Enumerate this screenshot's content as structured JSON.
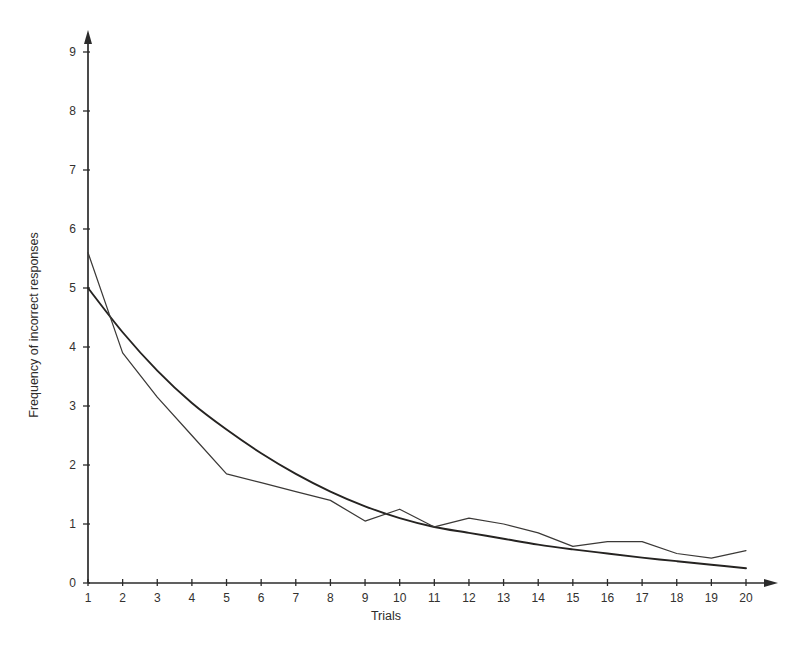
{
  "figure": {
    "background_color": "#ffffff",
    "ink_color": "#2b2b2b"
  },
  "chart_data": {
    "type": "line",
    "title": "",
    "subtitle": "",
    "xlabel": "Trials",
    "ylabel": "Frequency of incorrect responses",
    "xlim": [
      1,
      20
    ],
    "ylim": [
      0,
      9.4
    ],
    "grid": false,
    "legend_position": "none",
    "x": [
      1,
      2,
      3,
      4,
      5,
      6,
      7,
      8,
      9,
      10,
      11,
      12,
      13,
      14,
      15,
      16,
      17,
      18,
      19,
      20
    ],
    "categories": [
      "1",
      "2",
      "3",
      "4",
      "5",
      "6",
      "7",
      "8",
      "9",
      "10",
      "11",
      "12",
      "13",
      "14",
      "15",
      "16",
      "17",
      "18",
      "19",
      "20"
    ],
    "xticks": [
      1,
      2,
      3,
      4,
      5,
      6,
      7,
      8,
      9,
      10,
      11,
      12,
      13,
      14,
      15,
      16,
      17,
      18,
      19,
      20
    ],
    "xticklabels": [
      "1",
      "2",
      "3",
      "4",
      "5",
      "6",
      "7",
      "8",
      "9",
      "10",
      "11",
      "12",
      "13",
      "14",
      "15",
      "16",
      "17",
      "18",
      "19",
      "20"
    ],
    "yticks": [
      0,
      1,
      2,
      3,
      4,
      5,
      6,
      7,
      8,
      9
    ],
    "yticklabels": [
      "0",
      "1",
      "2",
      "3",
      "4",
      "5",
      "6",
      "7",
      "8",
      "9"
    ],
    "series": [
      {
        "name": "Observed frequency",
        "style": "thin-jagged",
        "color": "#3b3937",
        "values": [
          5.6,
          3.9,
          3.15,
          2.5,
          1.85,
          1.7,
          1.55,
          1.4,
          1.05,
          1.25,
          0.95,
          1.1,
          1.0,
          0.85,
          0.62,
          0.7,
          0.7,
          0.5,
          0.42,
          0.55
        ]
      },
      {
        "name": "Fitted exponential curve",
        "style": "thick-smooth",
        "color": "#252321",
        "values": [
          5.0,
          4.25,
          3.6,
          3.05,
          2.6,
          2.2,
          1.85,
          1.55,
          1.3,
          1.1,
          0.95,
          0.85,
          0.75,
          0.65,
          0.57,
          0.5,
          0.43,
          0.37,
          0.31,
          0.25
        ]
      }
    ],
    "annotations": []
  }
}
